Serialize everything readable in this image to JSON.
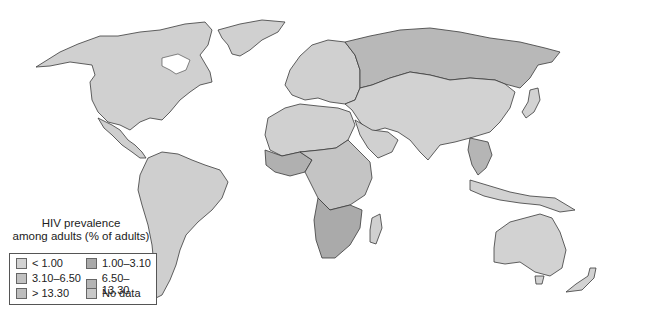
{
  "map": {
    "type": "choropleth",
    "subject": "HIV prevalence among adults",
    "projection": "world",
    "background": "#ffffff",
    "border_color": "#3a3a3a"
  },
  "legend": {
    "title_line1": "HIV prevalence",
    "title_line2": "among adults (% of adults)",
    "items": [
      {
        "label": "< 1.00",
        "color": "#d2d2d2"
      },
      {
        "label": "1.00–3.10",
        "color": "#a9a9a9"
      },
      {
        "label": "3.10–6.50",
        "color": "#c1c1c1"
      },
      {
        "label": "6.50–13.30",
        "color": "#b4b4b4"
      },
      {
        "label": "> 13.30",
        "color": "#bdbdbd"
      },
      {
        "label": "No data",
        "color": "#c8c8c8"
      }
    ]
  },
  "regions": {
    "north_america": {
      "category": "< 1.00",
      "color": "#d0d0d0"
    },
    "greenland": {
      "category": "< 1.00",
      "color": "#d0d0d0"
    },
    "central_america": {
      "category": "< 1.00",
      "color": "#cfcfcf"
    },
    "south_america": {
      "category": "< 1.00",
      "color": "#cfcfcf"
    },
    "europe": {
      "category": "< 1.00",
      "color": "#d0d0d0"
    },
    "russia": {
      "category": "1.00–3.10",
      "color": "#b8b8b8"
    },
    "asia": {
      "category": "< 1.00",
      "color": "#d2d2d2"
    },
    "southeast_asia": {
      "category": "1.00–3.10",
      "color": "#b5b5b5"
    },
    "north_africa": {
      "category": "< 1.00",
      "color": "#d0d0d0"
    },
    "west_africa": {
      "category": "1.00–3.10",
      "color": "#b0b0b0"
    },
    "central_africa": {
      "category": "3.10–6.50",
      "color": "#c4c4c4"
    },
    "southern_africa": {
      "category": "> 13.30",
      "color": "#aaaaaa"
    },
    "australia": {
      "category": "< 1.00",
      "color": "#d2d2d2"
    },
    "new_zealand": {
      "category": "< 1.00",
      "color": "#d2d2d2"
    }
  }
}
